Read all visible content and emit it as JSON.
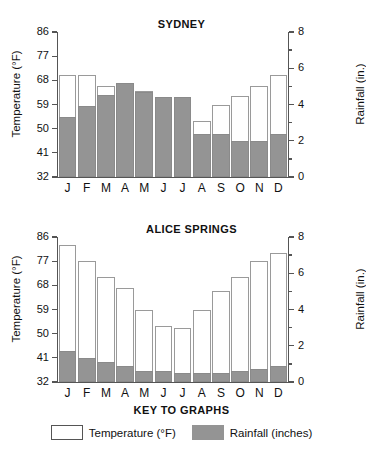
{
  "figure": {
    "months": [
      "J",
      "F",
      "M",
      "A",
      "M",
      "J",
      "J",
      "A",
      "S",
      "O",
      "N",
      "D"
    ],
    "colors": {
      "rainfall": "#949494",
      "temperature": "#ffffff",
      "axis": "#555555",
      "text": "#111111"
    }
  },
  "key": {
    "title": "KEY TO GRAPHS",
    "items": [
      {
        "label": "Temperature (°F)",
        "swatch": "temperature-swatch"
      },
      {
        "label": "Rainfall (inches)",
        "swatch": "rainfall-swatch"
      }
    ]
  },
  "axes": {
    "left_title": "Temperature (°F)",
    "right_title": "Rainfall (in.)",
    "temp_ticks": [
      "86",
      "77",
      "68",
      "59",
      "50",
      "41",
      "32"
    ],
    "temp_tick_values": [
      86,
      77,
      68,
      59,
      50,
      41,
      32
    ],
    "rain_ticks": [
      "8",
      "6",
      "4",
      "2",
      "0"
    ],
    "rain_tick_values": [
      8,
      6,
      4,
      2,
      0
    ],
    "temp_range": [
      32,
      86
    ],
    "rain_range": [
      0,
      8
    ]
  },
  "chart_data": [
    {
      "type": "bar",
      "title": "SYDNEY",
      "categories": [
        "J",
        "F",
        "M",
        "A",
        "M",
        "J",
        "J",
        "A",
        "S",
        "O",
        "N",
        "D"
      ],
      "xlabel": "",
      "ylabel": "Temperature (°F)",
      "y2label": "Rainfall (in.)",
      "ylim": [
        32,
        86
      ],
      "y2lim": [
        0,
        8
      ],
      "grid": false,
      "legend": "bottom",
      "series": [
        {
          "name": "Temperature (°F)",
          "axis": "left",
          "values": [
            70,
            70,
            66,
            67,
            64,
            61,
            61,
            53,
            59,
            62,
            66,
            70
          ]
        },
        {
          "name": "Rainfall (inches)",
          "axis": "right",
          "values": [
            3.3,
            3.9,
            4.5,
            5.2,
            4.7,
            4.4,
            4.4,
            2.4,
            2.4,
            2.0,
            2.0,
            2.4
          ]
        }
      ]
    },
    {
      "type": "bar",
      "title": "ALICE SPRINGS",
      "categories": [
        "J",
        "F",
        "M",
        "A",
        "M",
        "J",
        "J",
        "A",
        "S",
        "O",
        "N",
        "D"
      ],
      "xlabel": "",
      "ylabel": "Temperature (°F)",
      "y2label": "Rainfall (in.)",
      "ylim": [
        32,
        86
      ],
      "y2lim": [
        0,
        8
      ],
      "grid": false,
      "legend": "bottom",
      "series": [
        {
          "name": "Temperature (°F)",
          "axis": "left",
          "values": [
            83,
            77,
            71,
            67,
            59,
            53,
            52,
            59,
            66,
            71,
            77,
            80
          ]
        },
        {
          "name": "Rainfall (inches)",
          "axis": "right",
          "values": [
            1.7,
            1.3,
            1.1,
            0.9,
            0.6,
            0.6,
            0.5,
            0.5,
            0.5,
            0.6,
            0.7,
            0.9
          ]
        }
      ]
    }
  ]
}
